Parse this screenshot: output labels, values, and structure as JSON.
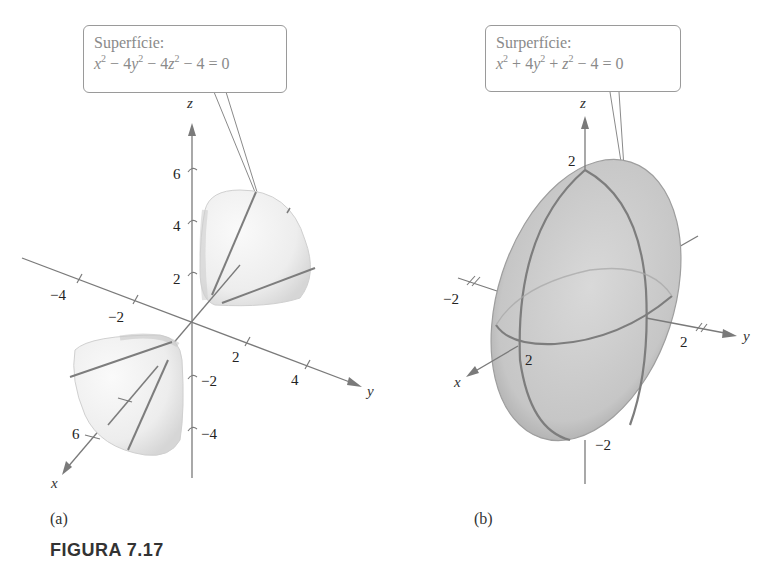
{
  "figure": {
    "caption": "FIGURA 7.17",
    "panel_a": {
      "label": "(a)",
      "callout_title": "Superfície:",
      "equation_parts": [
        "x",
        "2",
        " − 4y",
        "2",
        " − 4z",
        "2",
        " − 4 = 0"
      ],
      "equation_text": "x^2 − 4y^2 − 4z^2 − 4 = 0",
      "surface": "hyperboloid of two sheets",
      "axes": {
        "x_label": "x",
        "y_label": "y",
        "z_label": "z",
        "x_ticks": [
          "6"
        ],
        "y_ticks": [
          "−4",
          "−2",
          "2",
          "4"
        ],
        "z_ticks": [
          "6",
          "4",
          "2",
          "−2",
          "−4"
        ]
      }
    },
    "panel_b": {
      "label": "(b)",
      "callout_title": "Surperfície:",
      "equation_text": "x^2 + 4y^2 + z^2 − 4 = 0",
      "surface": "ellipsoid",
      "axes": {
        "x_label": "x",
        "y_label": "y",
        "z_label": "z",
        "x_ticks": [
          "2"
        ],
        "y_ticks": [
          "−2",
          "2"
        ],
        "z_ticks": [
          "2",
          "−2"
        ]
      }
    }
  },
  "colors": {
    "axis": "#7a7a7a",
    "surface_a": "#eeeeee",
    "surface_b": "#c8c8c8",
    "trace_lines": "#7d7d7d",
    "callout_text": "#8a8a8a"
  }
}
